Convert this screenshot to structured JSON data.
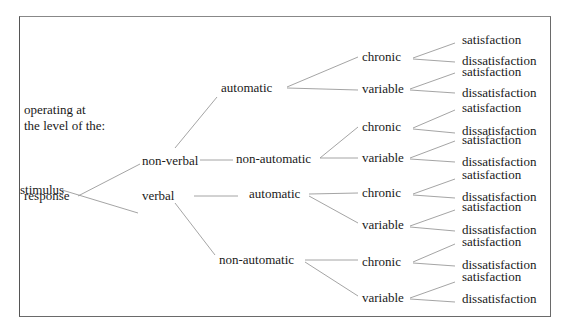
{
  "diagram": {
    "caption_line1": "operating at",
    "caption_line2": "the level of the:",
    "levels": {
      "stimulus": "stimulus",
      "response": "response"
    },
    "modes": {
      "non_verbal": "non-verbal",
      "verbal": "verbal"
    },
    "processing": {
      "nv_automatic": "automatic",
      "nv_non_automatic": "non-automatic",
      "v_automatic": "automatic",
      "v_non_automatic": "non-automatic"
    },
    "stability": [
      {
        "label": "chronic"
      },
      {
        "label": "variable"
      },
      {
        "label": "chronic"
      },
      {
        "label": "variable"
      },
      {
        "label": "chronic"
      },
      {
        "label": "variable"
      },
      {
        "label": "chronic"
      },
      {
        "label": "variable"
      }
    ],
    "outcomes": [
      {
        "label": "satisfaction"
      },
      {
        "label": "dissatisfaction"
      },
      {
        "label": "satisfaction"
      },
      {
        "label": "dissatisfaction"
      },
      {
        "label": "satisfaction"
      },
      {
        "label": "dissatisfaction"
      },
      {
        "label": "satisfaction"
      },
      {
        "label": "dissatisfaction"
      },
      {
        "label": "satisfaction"
      },
      {
        "label": "dissatisfaction"
      },
      {
        "label": "satisfaction"
      },
      {
        "label": "dissatisfaction"
      },
      {
        "label": "satisfaction"
      },
      {
        "label": "dissatisfaction"
      },
      {
        "label": "satisfaction"
      },
      {
        "label": "dissatisfaction"
      }
    ],
    "colors": {
      "frame": "#6a6a6a",
      "link": "#9a9a9a",
      "text": "#1a1a1a"
    }
  }
}
